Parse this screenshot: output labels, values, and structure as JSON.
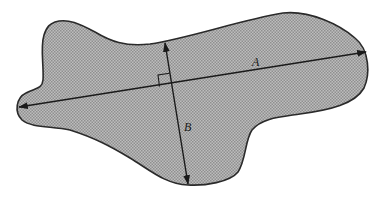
{
  "figure": {
    "colors": {
      "fill": "#a8a8a8",
      "outline": "#2a2a2a",
      "lines": "#1a1a1a",
      "background": "#ffffff"
    },
    "labels": {
      "axis_a": "A",
      "axis_b": "B"
    },
    "axis_a": {
      "from": [
        18,
        107
      ],
      "to": [
        367,
        52
      ]
    },
    "axis_b": {
      "from": [
        165,
        42
      ],
      "to": [
        188,
        184
      ]
    },
    "right_angle_marker": true
  }
}
